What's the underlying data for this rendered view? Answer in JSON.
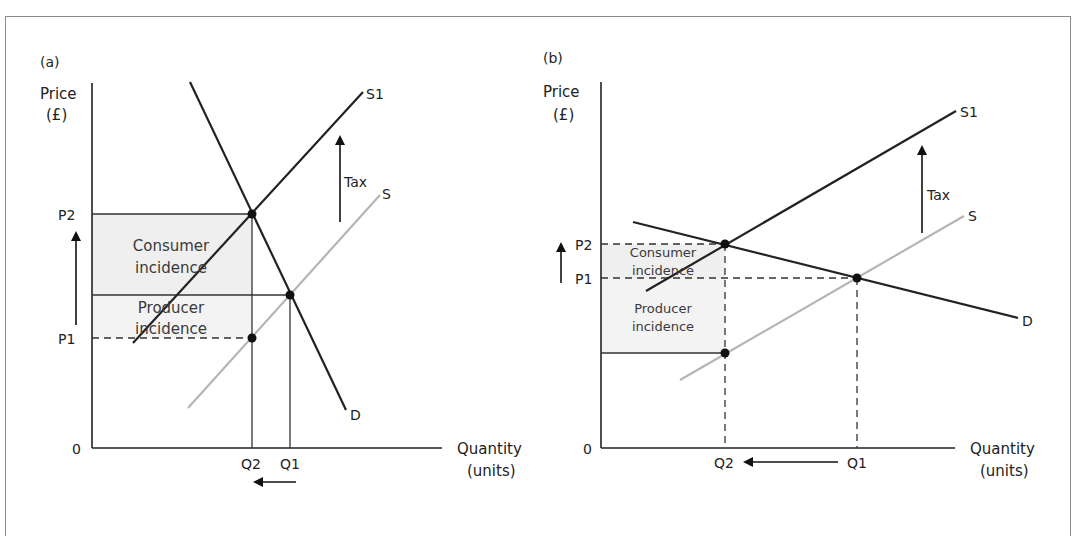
{
  "panels": {
    "a": {
      "panel_label": "(a)",
      "y_axis_label_line1": "Price",
      "y_axis_label_line2": "(£)",
      "x_axis_label_line1": "Quantity",
      "x_axis_label_line2": "(units)",
      "origin": "0",
      "price_labels": [
        "P2",
        "P1"
      ],
      "quantity_labels": [
        "Q2",
        "Q1"
      ],
      "curves": {
        "supply_new": "S1",
        "supply": "S",
        "demand": "D"
      },
      "tax_label": "Tax",
      "consumer_line1": "Consumer",
      "consumer_line2": "incidence",
      "producer_line1": "Producer",
      "producer_line2": "incidence"
    },
    "b": {
      "panel_label": "(b)",
      "y_axis_label_line1": "Price",
      "y_axis_label_line2": "(£)",
      "x_axis_label_line1": "Quantity",
      "x_axis_label_line2": "(units)",
      "origin": "0",
      "price_labels": [
        "P2",
        "P1"
      ],
      "quantity_labels": [
        "Q2",
        "Q1"
      ],
      "curves": {
        "supply_new": "S1",
        "supply": "S",
        "demand": "D"
      },
      "tax_label": "Tax",
      "consumer_line1": "Consumer",
      "consumer_line2": "incidence",
      "producer_line1": "Producer",
      "producer_line2": "incidence"
    }
  },
  "colors": {
    "line": "#222222",
    "supply_original": "#b5b5b5",
    "shade": "#efefef",
    "frame": "#8a8a8a"
  }
}
